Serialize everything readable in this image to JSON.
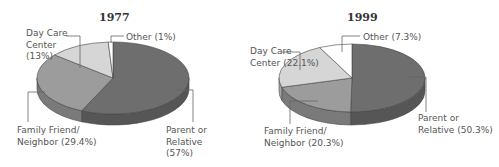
{
  "chart_data": [
    {
      "type": "pie",
      "title": "1977",
      "categories": [
        "Parent or Relative",
        "Family Friend/ Neighbor",
        "Day Care Center",
        "Other"
      ],
      "values": [
        57,
        29.4,
        13,
        1
      ],
      "labels": [
        "Parent or\nRelative\n(57%)",
        "Family Friend/\nNeighbor (29.4%)",
        "Day Care\nCenter\n(13%)",
        "Other (1%)"
      ],
      "colors": [
        "#6e6e6e",
        "#9c9c9c",
        "#d6d6d6",
        "#ffffff"
      ],
      "style": "3d"
    },
    {
      "type": "pie",
      "title": "1999",
      "categories": [
        "Parent or Relative",
        "Family Friend/ Neighbor",
        "Day Care Center",
        "Other"
      ],
      "values": [
        50.3,
        20.3,
        22.1,
        7.3
      ],
      "labels": [
        "Parent or\nRelative (50.3%)",
        "Family Friend/\nNeighbor (20.3%)",
        "Day Care\nCenter (22.1%)",
        "Other (7.3%)"
      ],
      "colors": [
        "#6e6e6e",
        "#9c9c9c",
        "#d6d6d6",
        "#ffffff"
      ],
      "style": "3d"
    }
  ]
}
